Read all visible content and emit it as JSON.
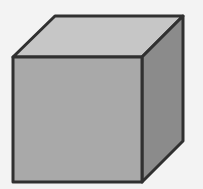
{
  "diagram": {
    "type": "cube",
    "colors": {
      "background": "#f3f3f3",
      "top_face": "#c6c6c6",
      "front_face": "#a9a9a9",
      "side_face": "#8b8b8b",
      "outline": "#303030"
    },
    "vertices": {
      "front_top_left": [
        13,
        57
      ],
      "front_top_right": [
        142,
        57
      ],
      "front_bottom_left": [
        13,
        182
      ],
      "front_bottom_right": [
        142,
        182
      ],
      "back_top_left": [
        55,
        16
      ],
      "back_top_right": [
        183,
        16
      ],
      "back_bottom_right": [
        183,
        141
      ]
    }
  }
}
